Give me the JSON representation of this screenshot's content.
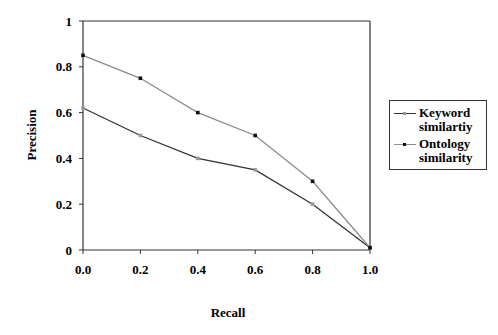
{
  "chart_data": {
    "type": "line",
    "title": "",
    "xlabel": "Recall",
    "ylabel": "Precision",
    "x": [
      0.0,
      0.2,
      0.4,
      0.6,
      0.8,
      1.0
    ],
    "x_tick_labels": [
      "0.0",
      "0.2",
      "0.4",
      "0.6",
      "0.8",
      "1.0"
    ],
    "y_tick_labels": [
      "0",
      "0.2",
      "0.4",
      "0.6",
      "0.8",
      "1"
    ],
    "xlim": [
      0,
      1
    ],
    "ylim": [
      0,
      1
    ],
    "grid": false,
    "legend_position": "right",
    "series": [
      {
        "name": "Keyword similartiy",
        "color": "#333333",
        "marker_color": "#999999",
        "values": [
          0.62,
          0.5,
          0.4,
          0.35,
          0.2,
          0.01
        ]
      },
      {
        "name": "Ontology similarity",
        "color": "#8c8c8c",
        "marker_color": "#111111",
        "values": [
          0.85,
          0.75,
          0.6,
          0.5,
          0.3,
          0.01
        ]
      }
    ]
  },
  "legend": {
    "items": [
      {
        "label": "Keyword similartiy"
      },
      {
        "label": "Ontology similarity"
      }
    ]
  }
}
